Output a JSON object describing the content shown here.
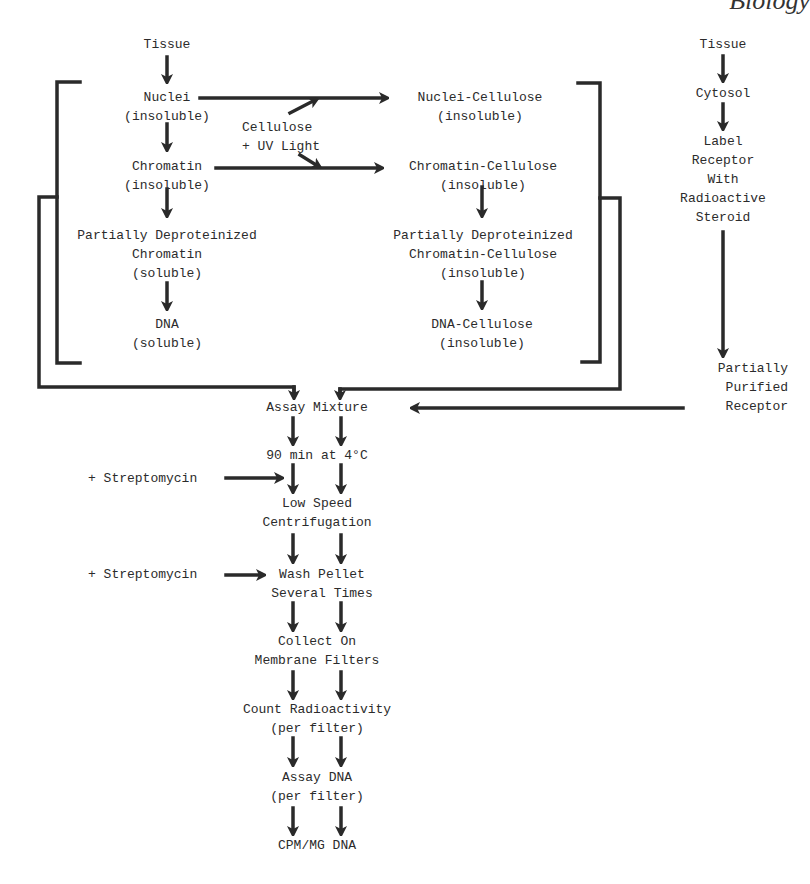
{
  "page_header_fragment": "Biology",
  "diagram": {
    "left_column": {
      "tissue": "Tissue",
      "nuclei": "Nuclei\n(insoluble)",
      "chromatin": "Chromatin\n(insoluble)",
      "partially_deproteinized": "Partially Deproteinized\nChromatin\n(soluble)",
      "dna": "DNA\n(soluble)"
    },
    "middle": {
      "cellulose_uv": "Cellulose\n+ UV Light"
    },
    "right_column": {
      "nuclei_cellulose": "Nuclei-Cellulose\n(insoluble)",
      "chromatin_cellulose": "Chromatin-Cellulose\n(insoluble)",
      "partially_deproteinized_cellulose": "Partially Deproteinized\nChromatin-Cellulose\n(insoluble)",
      "dna_cellulose": "DNA-Cellulose\n(insoluble)"
    },
    "receptor_column": {
      "tissue": "Tissue",
      "cytosol": "Cytosol",
      "label_receptor": "Label\nReceptor\nWith\nRadioactive\nSteroid",
      "partially_purified": "Partially\nPurified\nReceptor"
    },
    "assay_steps": {
      "assay_mixture": "Assay Mixture",
      "incubation": "90 min at 4°C",
      "streptomycin_1": "+ Streptomycin",
      "centrifugation": "Low Speed\nCentrifugation",
      "streptomycin_2": "+ Streptomycin",
      "wash": "Wash Pellet\nSeveral Times",
      "collect": "Collect On\nMembrane Filters",
      "count": "Count Radioactivity\n(per filter)",
      "assay_dna": "Assay DNA\n(per filter)",
      "result": "CPM/MG DNA"
    }
  }
}
